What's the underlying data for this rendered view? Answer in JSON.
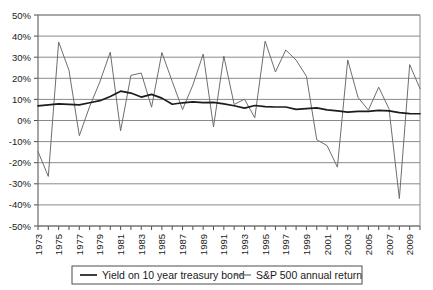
{
  "chart_data": {
    "type": "line",
    "title": "",
    "xlabel": "",
    "ylabel": "",
    "ylim": [
      -50,
      50
    ],
    "ytick_step": 10,
    "grid": true,
    "legend_position": "bottom",
    "ytick_labels": [
      "50%",
      "40%",
      "30%",
      "20%",
      "10%",
      "0%",
      "-10%",
      "-20%",
      "-30%",
      "-40%",
      "-50%"
    ],
    "ytick_values": [
      50,
      40,
      30,
      20,
      10,
      0,
      -10,
      -20,
      -30,
      -40,
      -50
    ],
    "x": [
      1973,
      1974,
      1975,
      1976,
      1977,
      1978,
      1979,
      1980,
      1981,
      1982,
      1983,
      1984,
      1985,
      1986,
      1987,
      1988,
      1989,
      1990,
      1991,
      1992,
      1993,
      1994,
      1995,
      1996,
      1997,
      1998,
      1999,
      2000,
      2001,
      2002,
      2003,
      2004,
      2005,
      2006,
      2007,
      2008,
      2009,
      2010
    ],
    "xtick_labels": [
      "1973",
      "1975",
      "1977",
      "1979",
      "1981",
      "1983",
      "1985",
      "1987",
      "1989",
      "1991",
      "1993",
      "1995",
      "1997",
      "1999",
      "2001",
      "2003",
      "2005",
      "2007",
      "2009"
    ],
    "xtick_label_values": [
      1973,
      1975,
      1977,
      1979,
      1981,
      1983,
      1985,
      1987,
      1989,
      1991,
      1993,
      1995,
      1997,
      1999,
      2001,
      2003,
      2005,
      2007,
      2009
    ],
    "series": [
      {
        "name": "Yield on 10 year treasury bond",
        "color": "#1c1c1c",
        "values": [
          6.9,
          7.4,
          7.9,
          7.6,
          7.4,
          8.4,
          9.4,
          11.4,
          13.9,
          13.0,
          11.1,
          12.4,
          10.6,
          7.7,
          8.4,
          8.8,
          8.5,
          8.6,
          7.9,
          7.0,
          5.9,
          7.1,
          6.6,
          6.4,
          6.4,
          5.3,
          5.6,
          6.0,
          5.0,
          4.6,
          4.0,
          4.3,
          4.3,
          4.8,
          4.6,
          3.7,
          3.3,
          3.2
        ]
      },
      {
        "name": "S&P 500 annual return",
        "color": "#6e6e6e",
        "values": [
          -14.7,
          -26.5,
          37.2,
          23.8,
          -7.2,
          6.6,
          18.4,
          32.4,
          -4.9,
          21.4,
          22.5,
          6.3,
          32.2,
          18.5,
          5.2,
          16.8,
          31.5,
          -3.1,
          30.5,
          7.6,
          10.1,
          1.3,
          37.6,
          23.0,
          33.4,
          28.6,
          21.0,
          -9.1,
          -11.9,
          -22.1,
          28.7,
          10.9,
          4.9,
          15.8,
          5.5,
          -37.0,
          26.5,
          15.1
        ]
      }
    ]
  },
  "legend": {
    "entries": [
      {
        "label": "Yield on 10 year treasury bond"
      },
      {
        "label": "S&P 500 annual return"
      }
    ]
  }
}
